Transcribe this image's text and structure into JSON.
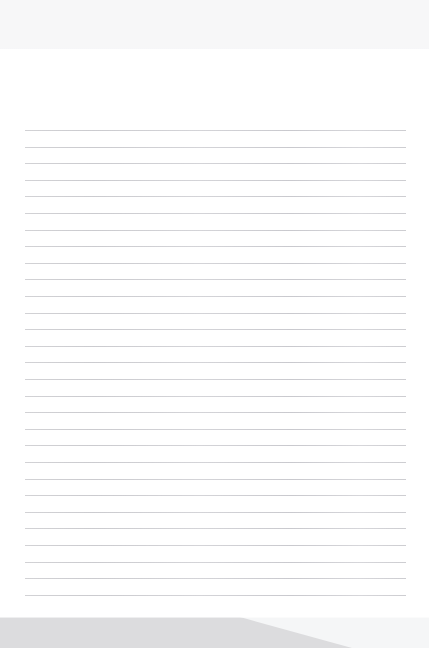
{
  "window": {
    "title": "Blank ruled notepad page",
    "width": 429,
    "height": 648,
    "background_color": "#ffffff"
  },
  "top_band": {
    "name": "top-chrome-band",
    "color": "#f7f7f8",
    "height_px": 49,
    "label": ""
  },
  "paper": {
    "name": "lined-paper-sheet",
    "background_color": "#ffffff",
    "top_px": 49,
    "height_px": 568,
    "content_text": "",
    "placeholder": ""
  },
  "ruled_lines": {
    "name": "ruled-line-set",
    "color": "#cfcfd2",
    "count": 29,
    "first_line_y": 130,
    "spacing_px": 16.6,
    "left_x": 25,
    "right_x": 406,
    "thickness_px": 1,
    "y_positions": [
      130,
      146.6,
      163.2,
      179.8,
      196.4,
      213.0,
      229.6,
      246.2,
      262.8,
      279.4,
      296.0,
      312.6,
      329.2,
      345.8,
      362.4,
      379.0,
      395.6,
      412.2,
      428.8,
      445.4,
      462.0,
      478.6,
      495.2,
      511.8,
      528.4,
      545.0,
      561.6,
      578.2,
      594.8
    ]
  },
  "bottom_band": {
    "name": "bottom-chrome-band",
    "fill_color": "#dcdcde",
    "background_color": "#f5f6f7",
    "top_px": 617,
    "height_px": 31,
    "diagonal_start_x": 240,
    "diagonal_end_x": 352,
    "label": ""
  }
}
